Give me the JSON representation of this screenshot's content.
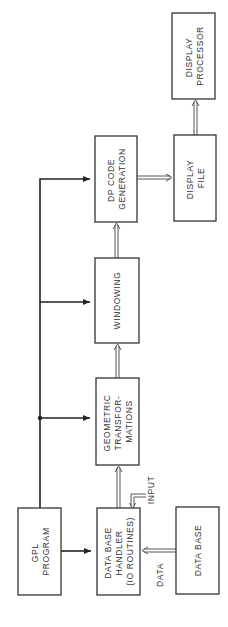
{
  "diagram": {
    "orientation": "rotated-90-ccw",
    "nodes": [
      {
        "id": "gpl",
        "lines": [
          "GPL",
          "PROGRAM"
        ]
      },
      {
        "id": "dbh",
        "lines": [
          "DATA BASE",
          "HANDLER",
          "(IO ROUTINES)"
        ]
      },
      {
        "id": "db",
        "lines": [
          "DATA BASE"
        ]
      },
      {
        "id": "geo",
        "lines": [
          "GEOMETRIC",
          "TRANSFOR-",
          "MATIONS"
        ]
      },
      {
        "id": "win",
        "lines": [
          "WINDOWING"
        ]
      },
      {
        "id": "dpc",
        "lines": [
          "DP CODE",
          "GENERATION"
        ]
      },
      {
        "id": "df",
        "lines": [
          "DISPLAY",
          "FILE"
        ]
      },
      {
        "id": "dp",
        "lines": [
          "DISPLAY",
          "PROCESSOR"
        ]
      }
    ],
    "edge_labels": {
      "input": "INPUT",
      "data": "DATA"
    },
    "edges": [
      {
        "from": "gpl",
        "to": "dbh",
        "style": "single"
      },
      {
        "from": "gpl",
        "to": "geo",
        "style": "single"
      },
      {
        "from": "gpl",
        "to": "win",
        "style": "single"
      },
      {
        "from": "gpl",
        "to": "dpc",
        "style": "single"
      },
      {
        "from": "db",
        "to": "dbh",
        "style": "double",
        "label": "DATA"
      },
      {
        "from": "input",
        "to": "dbh",
        "style": "double",
        "label": "INPUT"
      },
      {
        "from": "dbh",
        "to": "geo",
        "style": "double"
      },
      {
        "from": "geo",
        "to": "win",
        "style": "double"
      },
      {
        "from": "win",
        "to": "dpc",
        "style": "double"
      },
      {
        "from": "dpc",
        "to": "df",
        "style": "double"
      },
      {
        "from": "df",
        "to": "dp",
        "style": "double"
      }
    ]
  }
}
